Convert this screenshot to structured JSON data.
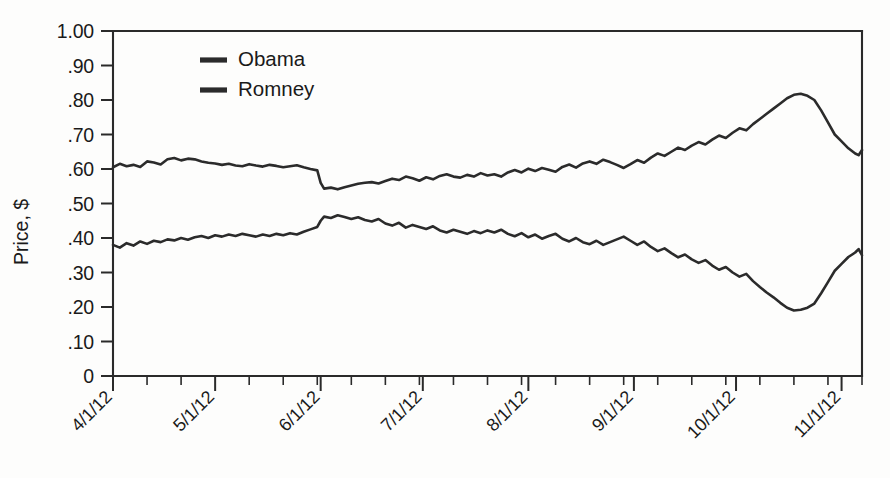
{
  "chart_data": {
    "type": "line",
    "title": "",
    "xlabel": "",
    "ylabel": "Price, $",
    "ylim": [
      0,
      1.0
    ],
    "yticks": [
      0,
      0.1,
      0.2,
      0.3,
      0.4,
      0.5,
      0.6,
      0.7,
      0.8,
      0.9,
      1.0
    ],
    "ytick_labels": [
      "0",
      ".10",
      ".20",
      ".30",
      ".40",
      ".50",
      ".60",
      ".70",
      ".80",
      ".90",
      "1.00"
    ],
    "xlim": [
      "4/1/12",
      "11/7/12"
    ],
    "xticks": [
      "4/1/12",
      "5/1/12",
      "6/1/12",
      "7/1/12",
      "8/1/12",
      "9/1/12",
      "10/1/12",
      "11/1/12"
    ],
    "xtick_labels": [
      "4/1/12",
      "5/1/12",
      "6/1/12",
      "7/1/12",
      "8/1/12",
      "9/1/12",
      "10/1/12",
      "11/1/12"
    ],
    "xtick_rotation": 45,
    "minor_tick_interval_days": 10,
    "grid": false,
    "legend_position": "upper-left-inside",
    "line_color": "#2b2b2b",
    "background_color": "#fdfdfc",
    "axis_color": "#2a2a2a",
    "series": [
      {
        "name": "Obama",
        "x_days_from_apr1": [
          0,
          2,
          4,
          6,
          8,
          10,
          12,
          14,
          16,
          18,
          20,
          22,
          24,
          26,
          28,
          30,
          32,
          34,
          36,
          38,
          40,
          42,
          44,
          46,
          48,
          50,
          52,
          54,
          56,
          58,
          60,
          61,
          62,
          64,
          66,
          68,
          70,
          72,
          74,
          76,
          78,
          80,
          82,
          84,
          86,
          88,
          90,
          92,
          94,
          96,
          98,
          100,
          102,
          104,
          106,
          108,
          110,
          112,
          114,
          116,
          118,
          120,
          122,
          124,
          126,
          128,
          130,
          132,
          134,
          136,
          138,
          140,
          142,
          144,
          146,
          148,
          150,
          152,
          154,
          156,
          158,
          160,
          162,
          164,
          166,
          168,
          170,
          172,
          174,
          176,
          178,
          180,
          182,
          184,
          186,
          188,
          190,
          192,
          194,
          196,
          198,
          200,
          202,
          204,
          206,
          208,
          210,
          212,
          214,
          216,
          218,
          219,
          220
        ],
        "values": [
          0.605,
          0.615,
          0.608,
          0.612,
          0.606,
          0.622,
          0.619,
          0.613,
          0.628,
          0.632,
          0.625,
          0.63,
          0.628,
          0.622,
          0.618,
          0.616,
          0.612,
          0.615,
          0.61,
          0.608,
          0.614,
          0.61,
          0.607,
          0.612,
          0.609,
          0.605,
          0.608,
          0.611,
          0.605,
          0.6,
          0.596,
          0.56,
          0.543,
          0.546,
          0.541,
          0.547,
          0.552,
          0.557,
          0.56,
          0.562,
          0.558,
          0.565,
          0.572,
          0.568,
          0.578,
          0.573,
          0.566,
          0.576,
          0.57,
          0.58,
          0.585,
          0.578,
          0.575,
          0.583,
          0.578,
          0.588,
          0.581,
          0.585,
          0.578,
          0.59,
          0.597,
          0.59,
          0.601,
          0.594,
          0.603,
          0.598,
          0.592,
          0.606,
          0.613,
          0.604,
          0.616,
          0.622,
          0.615,
          0.627,
          0.62,
          0.612,
          0.603,
          0.614,
          0.626,
          0.618,
          0.633,
          0.645,
          0.638,
          0.65,
          0.662,
          0.655,
          0.668,
          0.678,
          0.671,
          0.685,
          0.697,
          0.69,
          0.705,
          0.718,
          0.712,
          0.73,
          0.745,
          0.76,
          0.775,
          0.79,
          0.805,
          0.815,
          0.818,
          0.812,
          0.8,
          0.77,
          0.735,
          0.7,
          0.68,
          0.66,
          0.645,
          0.64,
          0.655,
          0.67,
          0.66,
          0.648,
          0.64,
          0.618,
          0.596,
          0.61,
          0.63,
          0.66,
          0.72,
          0.86,
          1.0
        ]
      },
      {
        "name": "Romney",
        "x_days_from_apr1": [
          0,
          2,
          4,
          6,
          8,
          10,
          12,
          14,
          16,
          18,
          20,
          22,
          24,
          26,
          28,
          30,
          32,
          34,
          36,
          38,
          40,
          42,
          44,
          46,
          48,
          50,
          52,
          54,
          56,
          58,
          60,
          61,
          62,
          64,
          66,
          68,
          70,
          72,
          74,
          76,
          78,
          80,
          82,
          84,
          86,
          88,
          90,
          92,
          94,
          96,
          98,
          100,
          102,
          104,
          106,
          108,
          110,
          112,
          114,
          116,
          118,
          120,
          122,
          124,
          126,
          128,
          130,
          132,
          134,
          136,
          138,
          140,
          142,
          144,
          146,
          148,
          150,
          152,
          154,
          156,
          158,
          160,
          162,
          164,
          166,
          168,
          170,
          172,
          174,
          176,
          178,
          180,
          182,
          184,
          186,
          188,
          190,
          192,
          194,
          196,
          198,
          200,
          202,
          204,
          206,
          208,
          210,
          212,
          214,
          216,
          218,
          219,
          220
        ],
        "values": [
          0.38,
          0.372,
          0.385,
          0.378,
          0.39,
          0.383,
          0.392,
          0.388,
          0.396,
          0.393,
          0.4,
          0.395,
          0.402,
          0.406,
          0.4,
          0.408,
          0.404,
          0.41,
          0.406,
          0.412,
          0.408,
          0.404,
          0.41,
          0.406,
          0.412,
          0.408,
          0.414,
          0.41,
          0.418,
          0.425,
          0.432,
          0.45,
          0.462,
          0.458,
          0.466,
          0.461,
          0.455,
          0.46,
          0.452,
          0.448,
          0.455,
          0.442,
          0.436,
          0.444,
          0.43,
          0.438,
          0.432,
          0.426,
          0.434,
          0.422,
          0.416,
          0.424,
          0.418,
          0.412,
          0.42,
          0.414,
          0.422,
          0.416,
          0.424,
          0.412,
          0.405,
          0.414,
          0.402,
          0.41,
          0.398,
          0.406,
          0.412,
          0.398,
          0.39,
          0.4,
          0.388,
          0.382,
          0.392,
          0.38,
          0.388,
          0.396,
          0.404,
          0.392,
          0.38,
          0.39,
          0.374,
          0.362,
          0.37,
          0.356,
          0.344,
          0.352,
          0.338,
          0.328,
          0.336,
          0.32,
          0.308,
          0.316,
          0.3,
          0.288,
          0.296,
          0.275,
          0.258,
          0.242,
          0.228,
          0.212,
          0.198,
          0.19,
          0.192,
          0.198,
          0.21,
          0.24,
          0.272,
          0.305,
          0.325,
          0.345,
          0.358,
          0.368,
          0.35,
          0.338,
          0.352,
          0.368,
          0.42,
          0.4,
          0.385,
          0.37,
          0.34,
          0.28,
          0.15,
          0.0
        ]
      }
    ],
    "legend": [
      {
        "name": "Obama"
      },
      {
        "name": "Romney"
      }
    ]
  }
}
